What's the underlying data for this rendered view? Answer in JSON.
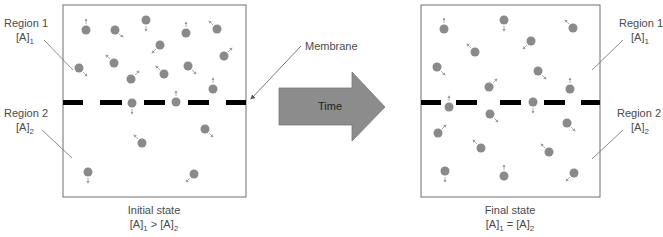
{
  "diagram": {
    "membrane_label": "Membrane",
    "arrow_label": "Time",
    "colors": {
      "particle": "#8a8a8a",
      "arrow_fill": "#8c8c8c",
      "membrane": "#000000",
      "box_border": "#6e6e6e",
      "leader_line": "#6e6e6e"
    },
    "panels": [
      {
        "id": "initial",
        "caption": "Initial state",
        "relation_left": "[A]",
        "relation_left_sub": "1",
        "relation_op": " > ",
        "relation_right": "[A]",
        "relation_right_sub": "2",
        "region1": {
          "name": "Region 1",
          "conc": "[A]",
          "sub": "1"
        },
        "region2": {
          "name": "Region 2",
          "conc": "[A]",
          "sub": "2"
        },
        "particle_count_region1": 12,
        "particle_count_region2": 4
      },
      {
        "id": "final",
        "caption": "Final state",
        "relation_left": "[A]",
        "relation_left_sub": "1",
        "relation_op": " = ",
        "relation_right": "[A]",
        "relation_right_sub": "2",
        "region1": {
          "name": "Region 1",
          "conc": "[A]",
          "sub": "1"
        },
        "region2": {
          "name": "Region 2",
          "conc": "[A]",
          "sub": "2"
        },
        "particle_count_region1": 9,
        "particle_count_region2": 8
      }
    ]
  }
}
